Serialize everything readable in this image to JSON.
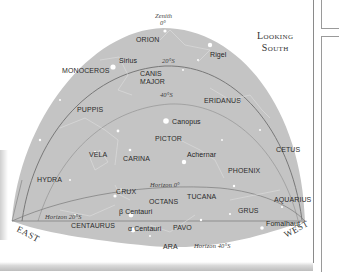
{
  "title": {
    "line1": "Looking",
    "line2": "South"
  },
  "zenith": {
    "label": "Zenith",
    "value": "0°"
  },
  "directions": {
    "east": "EAST",
    "west": "WEST"
  },
  "latitude_markers": {
    "lat20_upper": "20°S",
    "lat40_upper": "40°S",
    "horizon0": "Horizon 0°",
    "horizon20": "Horizon 20°S",
    "horizon40": "Horizon 40°S"
  },
  "constellations": [
    {
      "name": "ORION",
      "x": 136,
      "y": 36
    },
    {
      "name": "MONOCEROS",
      "x": 62,
      "y": 67
    },
    {
      "name": "CANIS MAJOR",
      "x": 138,
      "y": 70
    },
    {
      "name": "PUPPIS",
      "x": 77,
      "y": 106
    },
    {
      "name": "ERIDANUS",
      "x": 205,
      "y": 96
    },
    {
      "name": "PICTOR",
      "x": 155,
      "y": 135
    },
    {
      "name": "VELA",
      "x": 89,
      "y": 150
    },
    {
      "name": "CARINA",
      "x": 123,
      "y": 154
    },
    {
      "name": "PHOENIX",
      "x": 228,
      "y": 168
    },
    {
      "name": "CETUS",
      "x": 274,
      "y": 147
    },
    {
      "name": "HYDRA",
      "x": 37,
      "y": 176
    },
    {
      "name": "CRUX",
      "x": 116,
      "y": 188
    },
    {
      "name": "OCTANS",
      "x": 149,
      "y": 198
    },
    {
      "name": "TUCANA",
      "x": 187,
      "y": 193
    },
    {
      "name": "AQUARIUS",
      "x": 273,
      "y": 196
    },
    {
      "name": "GRUS",
      "x": 240,
      "y": 208
    },
    {
      "name": "CENTAURUS",
      "x": 71,
      "y": 223
    },
    {
      "name": "PAVO",
      "x": 173,
      "y": 224
    },
    {
      "name": "ARA",
      "x": 163,
      "y": 244
    }
  ],
  "stars": [
    {
      "name": "Sirius",
      "x": 119,
      "y": 57
    },
    {
      "name": "Rigel",
      "x": 210,
      "y": 50
    },
    {
      "name": "Canopus",
      "x": 170,
      "y": 121
    },
    {
      "name": "Achernar",
      "x": 187,
      "y": 151
    },
    {
      "name": "β Centauri",
      "x": 119,
      "y": 208
    },
    {
      "name": "α Centauri",
      "x": 126,
      "y": 227
    },
    {
      "name": "Fomalhaut",
      "x": 267,
      "y": 220
    }
  ]
}
